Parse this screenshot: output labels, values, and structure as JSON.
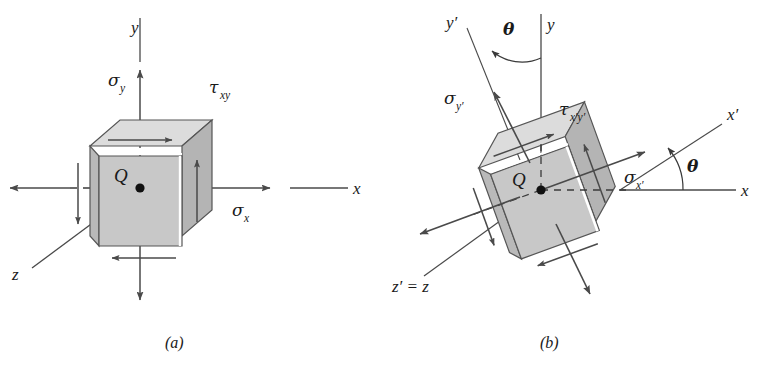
{
  "figure": {
    "background": "#ffffff",
    "width": 772,
    "height": 367,
    "ink_color": "#333333",
    "line_color": "#4a4a4a",
    "cube_front_fill": "#c8c8c8",
    "cube_top_fill": "#dcdcdc",
    "cube_side_fill": "#b4b4b4",
    "cube_edge": "#555555"
  },
  "panel_a": {
    "caption": "(a)",
    "point_label": "Q",
    "axes": [
      {
        "name": "y-axis",
        "label": "y",
        "direction": "vertical-up"
      },
      {
        "name": "x-axis",
        "label": "x",
        "direction": "horizontal-right"
      },
      {
        "name": "z-axis",
        "label": "z",
        "direction": "diagonal-lower-left"
      }
    ],
    "stresses": [
      {
        "name": "sigma-x",
        "base": "σ",
        "sub": "x",
        "kind": "normal",
        "axis": "x"
      },
      {
        "name": "sigma-y",
        "base": "σ",
        "sub": "y",
        "kind": "normal",
        "axis": "y"
      },
      {
        "name": "tau-xy",
        "base": "τ",
        "sub": "xy",
        "kind": "shear",
        "axis": "xy"
      }
    ]
  },
  "panel_b": {
    "caption": "(b)",
    "point_label": "Q",
    "angle_label": "θ",
    "angle_count": 2,
    "axes": [
      {
        "name": "y-axis",
        "label": "y",
        "direction": "vertical-up"
      },
      {
        "name": "x-axis",
        "label": "x",
        "direction": "horizontal-right"
      },
      {
        "name": "y-prime-axis",
        "label": "y′",
        "direction": "tilted-up-left"
      },
      {
        "name": "x-prime-axis",
        "label": "x′",
        "direction": "tilted-up-right"
      },
      {
        "name": "z-prime-axis",
        "label": "z′ = z",
        "direction": "diagonal-lower-left"
      }
    ],
    "stresses": [
      {
        "name": "sigma-x-prime",
        "base": "σ",
        "sub": "x′",
        "kind": "normal",
        "axis": "x'"
      },
      {
        "name": "sigma-y-prime",
        "base": "σ",
        "sub": "y′",
        "kind": "normal",
        "axis": "y'"
      },
      {
        "name": "tau-x-prime-y-prime",
        "base": "τ",
        "sub": "x′y′",
        "kind": "shear",
        "axis": "x'y'"
      }
    ]
  }
}
